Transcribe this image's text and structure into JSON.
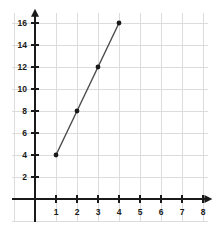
{
  "chart_data": {
    "type": "line",
    "title": "",
    "subtitle": "",
    "xlabel": "",
    "ylabel": "",
    "x": [
      1,
      2,
      3,
      4
    ],
    "values": [
      4,
      8,
      12,
      16
    ],
    "series": [
      {
        "name": "",
        "x": [
          1,
          2,
          3,
          4
        ],
        "values": [
          4,
          8,
          12,
          16
        ],
        "color": "#4a4a4a",
        "marker": "circle",
        "marker_color": "#1a1a1a"
      }
    ],
    "points": [
      {
        "x": 1,
        "y": 4
      },
      {
        "x": 2,
        "y": 8
      },
      {
        "x": 3,
        "y": 12
      },
      {
        "x": 4,
        "y": 16
      }
    ],
    "xlim": [
      0,
      8.4
    ],
    "ylim": [
      0,
      17.2
    ],
    "xticks": [
      1,
      2,
      3,
      4,
      5,
      6,
      7,
      8
    ],
    "yticks": [
      2,
      4,
      6,
      8,
      10,
      12,
      14,
      16
    ],
    "xtick_labels": [
      "1",
      "2",
      "3",
      "4",
      "5",
      "6",
      "7",
      "8"
    ],
    "ytick_labels": [
      "2",
      "4",
      "6",
      "8",
      "10",
      "12",
      "14",
      "16"
    ],
    "grid": true,
    "grid_color": "#dcdcdc",
    "grid_x_step": 1,
    "grid_y_step": 2,
    "legend": null,
    "legend_position": "none",
    "annotations": [],
    "axis_color": "#1a1a1a",
    "axis_arrows": [
      "x-right",
      "y-up"
    ],
    "background": "#ffffff"
  },
  "geometry": {
    "origin_x": 35,
    "origin_y": 199,
    "x_unit_px": 21,
    "y_unit_px": 11,
    "grid_left": 12,
    "grid_right": 208,
    "grid_top": 13,
    "grid_bottom": 222
  }
}
